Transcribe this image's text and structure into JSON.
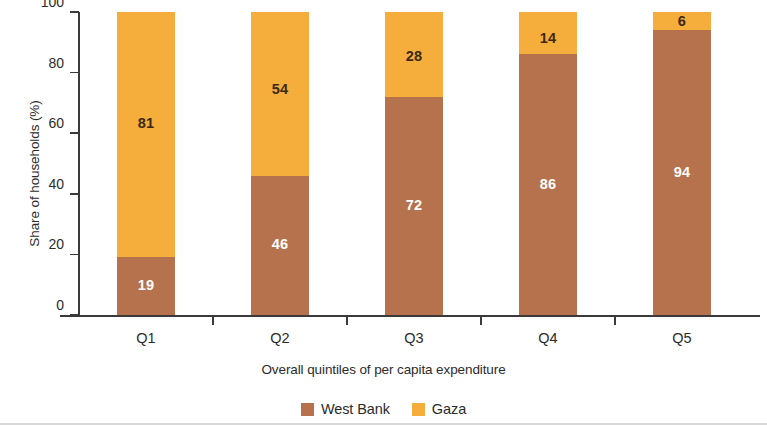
{
  "chart_data": {
    "type": "bar",
    "subtype": "stacked-100-percent",
    "title": "",
    "xlabel": "Overall quintiles of per capita expenditure",
    "ylabel": "Share of households (%)",
    "categories": [
      "Q1",
      "Q2",
      "Q3",
      "Q4",
      "Q5"
    ],
    "series": [
      {
        "name": "West Bank",
        "color": "#b5724d",
        "values": [
          19,
          46,
          72,
          86,
          94
        ]
      },
      {
        "name": "Gaza",
        "color": "#f5ad3c",
        "values": [
          81,
          54,
          28,
          14,
          6
        ]
      }
    ],
    "ylim": [
      0,
      100
    ],
    "yticks": [
      0,
      20,
      40,
      60,
      80,
      100
    ],
    "ytick_labels": [
      "0",
      "20",
      "40",
      "60",
      "80",
      "100"
    ],
    "grid": false,
    "legend_position": "bottom-center",
    "data_labels": true,
    "stack_order": [
      "West Bank",
      "Gaza"
    ]
  },
  "axes": {
    "y_title": "Share of households (%)",
    "x_title": "Overall quintiles of per capita expenditure",
    "y_tick_labels": [
      "100",
      "80",
      "60",
      "40",
      "20",
      "0"
    ],
    "x_tick_labels": [
      "Q1",
      "Q2",
      "Q3",
      "Q4",
      "Q5"
    ]
  },
  "legend": {
    "items": [
      {
        "label": "West Bank",
        "color": "#b5724d"
      },
      {
        "label": "Gaza",
        "color": "#f5ad3c"
      }
    ]
  },
  "bar_labels": {
    "q1": {
      "bottom": "19",
      "top": "81"
    },
    "q2": {
      "bottom": "46",
      "top": "54"
    },
    "q3": {
      "bottom": "72",
      "top": "28"
    },
    "q4": {
      "bottom": "86",
      "top": "14"
    },
    "q5": {
      "bottom": "94",
      "top": "6"
    }
  },
  "colors": {
    "west_bank": "#b5724d",
    "gaza": "#f5ad3c",
    "axis": "#3a3a3a",
    "text": "#2b2b2b",
    "background": "#ffffff"
  }
}
